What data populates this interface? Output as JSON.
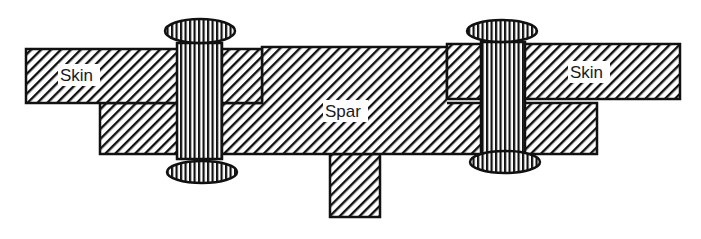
{
  "diagram": {
    "type": "bolted skin-spar joint cross-section",
    "labels": {
      "skin_left": "Skin",
      "skin_right": "Skin",
      "spar": "Spar"
    },
    "components": [
      {
        "name": "left skin",
        "hatch": "diagonal"
      },
      {
        "name": "right skin",
        "hatch": "diagonal"
      },
      {
        "name": "spar",
        "hatch": "diagonal"
      },
      {
        "name": "spar web / lower flange",
        "hatch": "diagonal"
      },
      {
        "name": "left bolt",
        "hatch": "vertical"
      },
      {
        "name": "right bolt",
        "hatch": "vertical"
      }
    ],
    "colors": {
      "stroke": "#111111",
      "background": "#ffffff"
    }
  }
}
